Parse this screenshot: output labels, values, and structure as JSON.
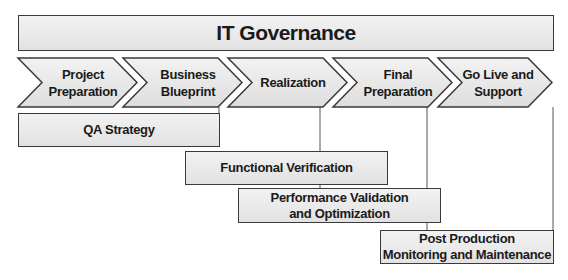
{
  "title": "IT Governance",
  "phases": [
    {
      "label": "Project\nPreparation"
    },
    {
      "label": "Business\nBlueprint"
    },
    {
      "label": "Realization"
    },
    {
      "label": "Final\nPreparation"
    },
    {
      "label": "Go Live and\nSupport"
    }
  ],
  "activities": [
    {
      "label": "QA Strategy"
    },
    {
      "label": "Functional Verification"
    },
    {
      "label": "Performance Validation\nand Optimization"
    },
    {
      "label": "Post Production\nMonitoring and Maintenance"
    }
  ],
  "colors": {
    "border": "#3a3a3a",
    "fill_light": "#f2f2f2",
    "fill_dark": "#e2e2e2",
    "text": "#1a1a1a"
  }
}
